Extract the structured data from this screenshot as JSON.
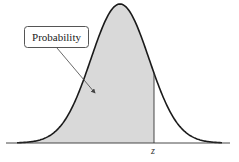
{
  "diagram": {
    "type": "normal-distribution-cdf",
    "callout_label": "Probability",
    "axis_label": "z",
    "colors": {
      "curve": "#1a1a1a",
      "shade": "#d9d9d9",
      "axis": "#333333",
      "callout_border": "#555555",
      "background": "#ffffff"
    }
  }
}
